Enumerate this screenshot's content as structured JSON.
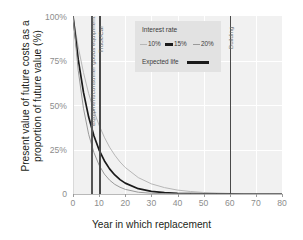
{
  "chart_data": {
    "type": "line",
    "title": "",
    "xlabel": "Year in which replacement",
    "ylabel": "Present value of future costs as a proportion of future value (%)",
    "xlim": [
      0,
      80
    ],
    "ylim": [
      0,
      100
    ],
    "grid": true,
    "legend_position": "top-center",
    "x_ticks": [
      "0",
      "10",
      "20",
      "30",
      "40",
      "50",
      "60",
      "70",
      "80"
    ],
    "x_tick_values": [
      0,
      10,
      20,
      30,
      40,
      50,
      60,
      70,
      80
    ],
    "y_ticks": [
      "0",
      "25%",
      "50%",
      "75%",
      "100%"
    ],
    "y_tick_values": [
      0,
      25,
      50,
      75,
      100
    ],
    "x": [
      0,
      2,
      4,
      6,
      8,
      10,
      12,
      14,
      16,
      18,
      20,
      25,
      30,
      35,
      40,
      45,
      50,
      55,
      60,
      65,
      70,
      75,
      80
    ],
    "series": [
      {
        "name": "10%",
        "color": "#b7b7b7",
        "values": [
          100,
          82.6,
          68.3,
          56.4,
          46.7,
          38.6,
          31.9,
          26.3,
          21.8,
          18.0,
          14.9,
          9.2,
          5.7,
          3.6,
          2.2,
          1.4,
          0.85,
          0.53,
          0.33,
          0.2,
          0.13,
          0.08,
          0.05
        ]
      },
      {
        "name": "15%",
        "color": "#1a1a1a",
        "values": [
          100,
          75.6,
          57.2,
          43.2,
          32.7,
          24.7,
          18.7,
          14.1,
          10.7,
          8.1,
          6.1,
          3.0,
          1.5,
          0.75,
          0.37,
          0.18,
          0.09,
          0.05,
          0.02,
          0.01,
          0.01,
          0.0,
          0.0
        ]
      },
      {
        "name": "20%",
        "color": "#9a9a9a",
        "values": [
          100,
          69.4,
          48.2,
          33.5,
          23.3,
          16.2,
          11.2,
          7.8,
          5.4,
          3.8,
          2.6,
          1.0,
          0.42,
          0.17,
          0.07,
          0.03,
          0.01,
          0.0,
          0.0,
          0.0,
          0.0,
          0.0,
          0.0
        ]
      }
    ],
    "annotations": [
      {
        "label": "Equipment/consumer goods equipment",
        "x": 7,
        "type": "vline"
      },
      {
        "label": "Truck/Car",
        "x": 10,
        "type": "vline"
      },
      {
        "label": "Building",
        "x": 60,
        "type": "vline"
      }
    ]
  },
  "axes": {
    "y_title_line1": "Present value of future costs as a",
    "y_title_line2": "proportion of future value (%)",
    "x_title": "Year in which replacement",
    "y_labels": [
      "100%",
      "75%",
      "50%",
      "25%",
      "0"
    ],
    "x_labels": [
      "0",
      "10",
      "20",
      "30",
      "40",
      "50",
      "60",
      "70",
      "80"
    ]
  },
  "legend": {
    "title": "Interest rate",
    "rate_items": [
      {
        "label": "10%",
        "color": "#b7b7b7"
      },
      {
        "label": "15%",
        "color": "#1a1a1a"
      },
      {
        "label": "20%",
        "color": "#9a9a9a"
      }
    ],
    "expected_life_label": "Expected life",
    "expected_life_color": "#1a1a1a"
  },
  "markers": {
    "equipment_label": "Equipment/consumer goods equipment",
    "truck_label": "Truck/Car",
    "building_label": "Building"
  },
  "colors": {
    "plot_background": "#f1f1f1",
    "grid": "#ffffff",
    "legend_background": "#e2e2e2",
    "tick_text": "#8d8d8d",
    "marker_line": "#555555"
  }
}
